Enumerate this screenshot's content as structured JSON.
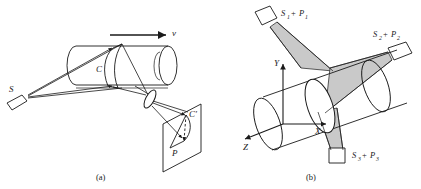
{
  "figure": {
    "background_color": "#ffffff",
    "stroke_color": "#1a1a1a",
    "shade_color": "#c9c9c9",
    "shade_color_dark": "#b4b4b4",
    "width": 421,
    "height": 189
  },
  "panel_a": {
    "caption": "(a)",
    "labels": {
      "source": "S",
      "cone": "C",
      "velocity": "v",
      "plane": "P",
      "image_cone": "C′"
    },
    "description": "Laser source S emits a light sheet that intersects a horizontal cylinder moving with velocity v, forming cone C; a lens images it onto plane P as C′."
  },
  "panel_b": {
    "caption": "(b)",
    "axes": {
      "x": "X",
      "y": "Y",
      "z": "Z"
    },
    "sources": [
      {
        "id": "s1",
        "label_s": "S",
        "label_s_sub": "1",
        "label_p": "P",
        "label_p_sub": "1",
        "plus": "+",
        "full": "S₁ + P₁"
      },
      {
        "id": "s2",
        "label_s": "S",
        "label_s_sub": "2",
        "label_p": "P",
        "label_p_sub": "2",
        "plus": "+",
        "full": "S₂ + P₂"
      },
      {
        "id": "s3",
        "label_s": "S",
        "label_s_sub": "3",
        "label_p": "P",
        "label_p_sub": "3",
        "plus": "+",
        "full": "S₃ + P₃"
      }
    ],
    "description": "Three source-plane pairs S1+P1, S2+P2, S3+P3 project shaded light cones onto a cylinder aligned with the X axis in an XYZ coordinate frame."
  }
}
